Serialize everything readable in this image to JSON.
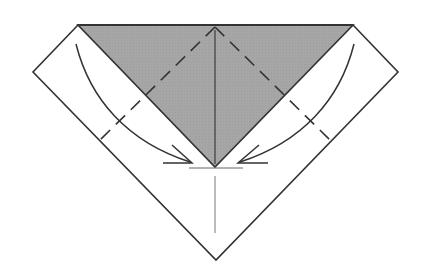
{
  "diagram": {
    "title": "Origami fold step: fold side edges to center",
    "colors": {
      "paper_back": "#a6a6a6",
      "paper_front": "#ffffff",
      "line": "#333333",
      "thin_line": "#666666"
    },
    "shapes": {
      "outer_outline": "78,25 353,25 398,72 216,260 33,72",
      "gray_triangle": "78,25 353,25 215,167",
      "left_flap_inner_edge": "78,25 215,167",
      "right_flap_inner_edge": "353,25 215,167"
    },
    "valley_folds": [
      {
        "name": "left-valley-fold",
        "from": [
          215,
          27
        ],
        "to": [
          100,
          140
        ]
      },
      {
        "name": "right-valley-fold",
        "from": [
          215,
          27
        ],
        "to": [
          330,
          140
        ]
      }
    ],
    "center_line": {
      "from": [
        215,
        27
      ],
      "to": [
        215,
        167
      ]
    },
    "center_line_lower": {
      "from": [
        215,
        178
      ],
      "to": [
        215,
        233
      ]
    },
    "reference_line": {
      "from": [
        190,
        168
      ],
      "to": [
        243,
        168
      ]
    },
    "arrows": [
      {
        "name": "left-fold-arrow",
        "path": "M76,44 C92,100 130,140 190,162",
        "head": [
          190,
          162
        ]
      },
      {
        "name": "right-fold-arrow",
        "path": "M354,44 C338,100 300,140 240,162",
        "head": [
          240,
          162
        ]
      }
    ]
  }
}
